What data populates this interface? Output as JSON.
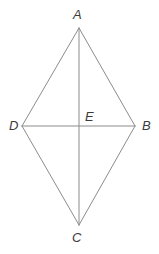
{
  "figure": {
    "type": "geometry-diagram",
    "shape_name": "rhombus-with-diagonals",
    "width": 159,
    "height": 254,
    "background_color": "#ffffff",
    "stroke_color": "#8c8c8c",
    "label_color": "#3b3b3b",
    "stroke_width": 1
  },
  "points": [
    {
      "id": "A",
      "label": "A",
      "x": 79,
      "y": 28,
      "label_x": 73,
      "label_y": 8,
      "role": "top-vertex"
    },
    {
      "id": "B",
      "label": "B",
      "x": 135,
      "y": 126,
      "label_x": 142,
      "label_y": 119,
      "role": "right-vertex"
    },
    {
      "id": "C",
      "label": "C",
      "x": 79,
      "y": 225,
      "label_x": 72,
      "label_y": 231,
      "role": "bottom-vertex"
    },
    {
      "id": "D",
      "label": "D",
      "x": 22,
      "y": 126,
      "label_x": 9,
      "label_y": 119,
      "role": "left-vertex"
    },
    {
      "id": "E",
      "label": "E",
      "x": 79,
      "y": 126,
      "label_x": 85,
      "label_y": 110,
      "role": "diagonal-intersection"
    }
  ],
  "segments": [
    {
      "id": "AB",
      "from": "A",
      "to": "B",
      "kind": "side"
    },
    {
      "id": "BC",
      "from": "B",
      "to": "C",
      "kind": "side"
    },
    {
      "id": "CD",
      "from": "C",
      "to": "D",
      "kind": "side"
    },
    {
      "id": "DA",
      "from": "D",
      "to": "A",
      "kind": "side"
    },
    {
      "id": "AC",
      "from": "A",
      "to": "C",
      "kind": "diagonal"
    },
    {
      "id": "DB",
      "from": "D",
      "to": "B",
      "kind": "diagonal"
    }
  ]
}
